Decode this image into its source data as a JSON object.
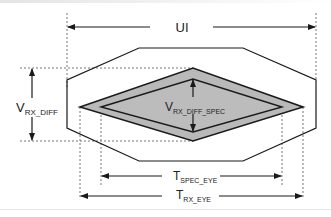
{
  "diagram": {
    "type": "eye-diagram",
    "labels": {
      "ui": "UI",
      "v_rx_diff": {
        "main": "V",
        "sub": "RX_DIFF"
      },
      "v_rx_diff_spec": {
        "main": "V",
        "sub": "RX_DIFF_SPEC"
      },
      "t_spec_eye": {
        "main": "T",
        "sub": "SPEC_EYE"
      },
      "t_rx_eye": {
        "main": "T",
        "sub": "RX_EYE"
      }
    },
    "colors": {
      "stroke": "#1a1a1a",
      "eye_fill": "#b9b9b9",
      "inner_fill": "#b9b9b9",
      "dashed": "#777777"
    }
  }
}
